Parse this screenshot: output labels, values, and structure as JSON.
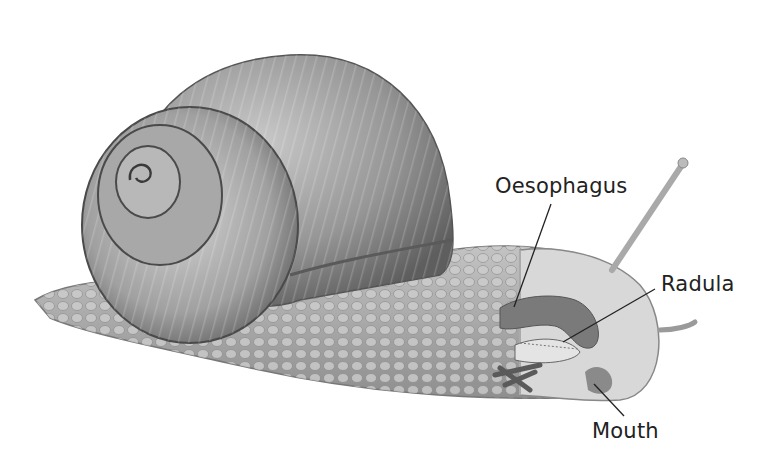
{
  "diagram": {
    "labels": [
      {
        "id": "oesophagus",
        "text": "Oesophagus",
        "x": 495,
        "y": 174,
        "line": [
          [
            551,
            204
          ],
          [
            514,
            307
          ]
        ]
      },
      {
        "id": "radula",
        "text": "Radula",
        "x": 661,
        "y": 272,
        "line": [
          [
            655,
            289
          ],
          [
            563,
            342
          ]
        ]
      },
      {
        "id": "mouth",
        "text": "Mouth",
        "x": 592,
        "y": 419,
        "line": [
          [
            624,
            416
          ],
          [
            594,
            384
          ]
        ]
      }
    ],
    "colors": {
      "background": "#ffffff",
      "shell_dark": "#6e6e6e",
      "shell_mid": "#9a9a9a",
      "shell_light": "#c8c8c8",
      "body": "#b5b5b5",
      "section": "#d6d6d6",
      "organ": "#7a7a7a",
      "line": "#222222"
    }
  }
}
